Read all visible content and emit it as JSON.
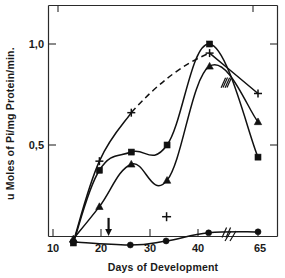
{
  "chart_data": {
    "type": "line",
    "title": "",
    "subtitle": "",
    "xlabel": "Days of Development",
    "ylabel": "u Moles of Pi/mg Protein/min.",
    "xlim": [
      8,
      68
    ],
    "ylim": [
      0,
      1.08
    ],
    "xticks": [
      10,
      20,
      30,
      40,
      65
    ],
    "xticklabels": [
      "10",
      "20",
      "30",
      "40",
      "65"
    ],
    "yticks": [
      0.5,
      1.0
    ],
    "yticklabels": [
      "0,5",
      "1,0"
    ],
    "grid": false,
    "legend_position": "none",
    "axis_break_x": 46,
    "annotations": [
      {
        "name": "down-arrow-marker",
        "x": 21.5,
        "y": 0.055,
        "note": "downward arrow on x-axis near day 21"
      },
      {
        "name": "isolated-plus-point",
        "x": 33.5,
        "y": 0.145,
        "marker": "plus"
      }
    ],
    "series": [
      {
        "name": "plus-series",
        "marker": "plus",
        "linestyle": "solid-with-dashed-segment",
        "points": [
          {
            "x": 14.2,
            "y": 0.02
          },
          {
            "x": 19.6,
            "y": 0.42
          },
          {
            "x": 26.2,
            "y": 0.66
          },
          {
            "x": 42.4,
            "y": 0.955
          },
          {
            "x": 65.0,
            "y": 0.755
          }
        ],
        "dashed_segment": [
          {
            "x": 26.2,
            "y": 0.66
          },
          {
            "x": 42.4,
            "y": 0.955
          }
        ]
      },
      {
        "name": "square-series",
        "marker": "square",
        "linestyle": "solid",
        "points": [
          {
            "x": 14.2,
            "y": 0.015
          },
          {
            "x": 19.6,
            "y": 0.375
          },
          {
            "x": 26.2,
            "y": 0.465
          },
          {
            "x": 33.6,
            "y": 0.5
          },
          {
            "x": 42.4,
            "y": 1.0
          },
          {
            "x": 65.0,
            "y": 0.44
          }
        ]
      },
      {
        "name": "triangle-series",
        "marker": "triangle",
        "linestyle": "solid",
        "points": [
          {
            "x": 14.2,
            "y": 0.035
          },
          {
            "x": 19.6,
            "y": 0.195
          },
          {
            "x": 26.2,
            "y": 0.405
          },
          {
            "x": 33.6,
            "y": 0.325
          },
          {
            "x": 42.4,
            "y": 0.89
          },
          {
            "x": 65.0,
            "y": 0.615
          }
        ]
      },
      {
        "name": "circle-series",
        "marker": "circle",
        "linestyle": "solid",
        "points": [
          {
            "x": 14.2,
            "y": 0.02
          },
          {
            "x": 26.0,
            "y": 0.005
          },
          {
            "x": 33.4,
            "y": 0.025
          },
          {
            "x": 42.2,
            "y": 0.065
          },
          {
            "x": 65.0,
            "y": 0.07
          }
        ]
      }
    ],
    "series_break_marks": [
      {
        "series": "square-series",
        "x": 45.8
      },
      {
        "series": "triangle-series",
        "x": 45.4
      },
      {
        "series": "circle-series",
        "x": 45.6
      }
    ]
  }
}
